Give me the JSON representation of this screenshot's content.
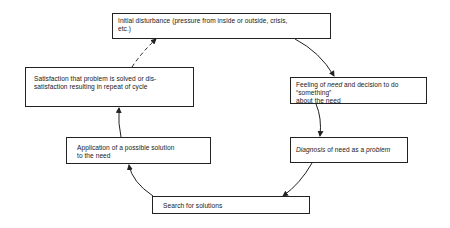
{
  "diagram": {
    "type": "cycle",
    "nodes": [
      {
        "id": "initial",
        "text": "Initial disturbance (pressure from inside or outside, crisis, etc.)"
      },
      {
        "id": "feeling",
        "text_parts": [
          "Feeling of ",
          "need",
          " and decision to do “something” about the need"
        ]
      },
      {
        "id": "diagnosis",
        "text_parts": [
          "Diagnosis",
          " of need as a ",
          "problem"
        ]
      },
      {
        "id": "search",
        "text": "Search for solutions"
      },
      {
        "id": "apply",
        "text": "Application of a possible solution to the need"
      },
      {
        "id": "satisfy",
        "text": "Satisfaction that problem is solved or dis-satisfaction resulting in repeat of cycle"
      }
    ],
    "edges": [
      {
        "from": "initial",
        "to": "feeling",
        "style": "solid"
      },
      {
        "from": "feeling",
        "to": "diagnosis",
        "style": "solid"
      },
      {
        "from": "diagnosis",
        "to": "search",
        "style": "solid"
      },
      {
        "from": "search",
        "to": "apply",
        "style": "solid"
      },
      {
        "from": "apply",
        "to": "satisfy",
        "style": "solid"
      },
      {
        "from": "satisfy",
        "to": "initial",
        "style": "dashed"
      }
    ]
  },
  "labels": {
    "initial_line1": "Initial disturbance (pressure from inside or outside, crisis,",
    "initial_line2": "etc.)",
    "feeling_pre": "Feeling of ",
    "feeling_italic": "need",
    "feeling_post": " and decision to do “something”",
    "feeling_line2": "about the need",
    "diagnosis_italic1": "Diagnosis",
    "diagnosis_mid": " of need as a ",
    "diagnosis_italic2": "problem",
    "search": "Search for solutions",
    "apply_line1": "Application of a possible solution",
    "apply_line2": "to the need",
    "satisfy_line1": "Satisfaction that problem is solved or dis-",
    "satisfy_line2": "satisfaction resulting in repeat of cycle"
  },
  "colors": {
    "line": "#222222",
    "background": "#ffffff"
  }
}
